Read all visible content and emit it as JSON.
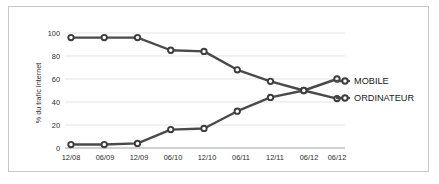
{
  "chart_data": {
    "type": "line",
    "title": "",
    "xlabel": "",
    "ylabel": "% du trafic Internet",
    "ylim": [
      0,
      100
    ],
    "yticks": [
      0,
      20,
      40,
      60,
      80,
      100
    ],
    "grid": true,
    "legend_position": "right",
    "categories": [
      "12/08",
      "06/09",
      "12/09",
      "06/10",
      "12/10",
      "06/11",
      "12/11",
      "06/12",
      "06/12"
    ],
    "series": [
      {
        "name": "ORDINATEUR",
        "values": [
          96,
          96,
          96,
          85,
          84,
          68,
          58,
          50,
          43
        ]
      },
      {
        "name": "MOBILE",
        "values": [
          3,
          3,
          4,
          16,
          17,
          32,
          44,
          50,
          60
        ]
      }
    ]
  },
  "axes": {
    "y_axis_title": "% du trafic Internet",
    "y_tick_labels": [
      "0",
      "20",
      "40",
      "60",
      "80",
      "100"
    ],
    "x_tick_labels": [
      "12/08",
      "06/09",
      "12/09",
      "06/10",
      "12/10",
      "06/11",
      "12/11",
      "06/12",
      "06/12"
    ]
  },
  "legend": {
    "items": [
      {
        "label": "MOBILE"
      },
      {
        "label": "ORDINATEUR"
      }
    ]
  },
  "colors": {
    "line": "#4a4a4a",
    "marker_fill": "#ffffff",
    "marker_stroke": "#3d3d3d",
    "gridline": "#d9d9d9",
    "axis": "#8c8c8c",
    "frame": "#c8c8c8",
    "text": "#2b2b2b",
    "background": "#ffffff"
  }
}
